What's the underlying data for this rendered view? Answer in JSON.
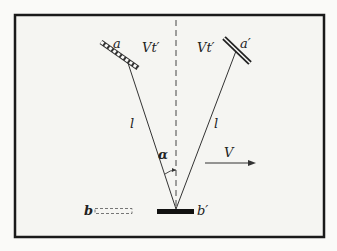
{
  "diagram": {
    "type": "light-clock mirror diagram",
    "labels": {
      "mirror_a": "a",
      "mirror_a_prime": "a′",
      "mirror_b": "b",
      "mirror_b_prime": "b′",
      "displacement_left": "Vt′",
      "displacement_right": "Vt′",
      "path_left": "l",
      "path_right": "l",
      "angle": "α",
      "velocity": "V"
    },
    "colors": {
      "background": "#fafaf8",
      "frame": "#1a1a1a",
      "line": "#333333"
    }
  }
}
